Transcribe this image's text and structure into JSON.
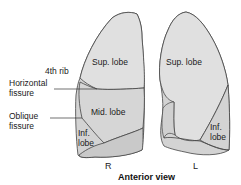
{
  "diagram": {
    "caption": "Anterior view",
    "colors": {
      "lung_fill": "#d6d6d6",
      "lung_fill_light": "#e2e2e2",
      "inferior_fill": "#cbcbcb",
      "outline": "#444444",
      "leader_line": "#333333"
    },
    "right_lung": {
      "side_label": "R",
      "lobes": {
        "superior": "Sup. lobe",
        "middle": "Mid. lobe",
        "inferior_line1": "Inf.",
        "inferior_line2": "lobe"
      }
    },
    "left_lung": {
      "side_label": "L",
      "lobes": {
        "superior": "Sup. lobe",
        "inferior_line1": "Inf.",
        "inferior_line2": "lobe"
      }
    },
    "annotations": {
      "rib": "4th rib",
      "horizontal_line1": "Horizontal",
      "horizontal_line2": "fissure",
      "oblique_line1": "Oblique",
      "oblique_line2": "fissure"
    }
  }
}
